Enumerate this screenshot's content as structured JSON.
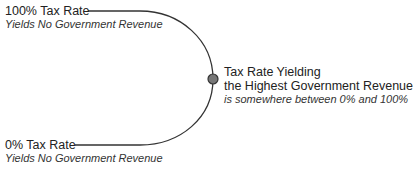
{
  "diagram": {
    "top": {
      "title": "100% Tax Rate",
      "subtitle": "Yields No Government Revenue"
    },
    "bottom": {
      "title": "0% Tax Rate",
      "subtitle": "Yields No Government Revenue"
    },
    "peak": {
      "title_line1": "Tax Rate Yielding",
      "title_line2": "the Highest Government Revenue",
      "subtitle": "is somewhere between 0% and 100%"
    },
    "colors": {
      "line": "#333333",
      "dot_fill": "#777777",
      "dot_stroke": "#333333"
    }
  }
}
